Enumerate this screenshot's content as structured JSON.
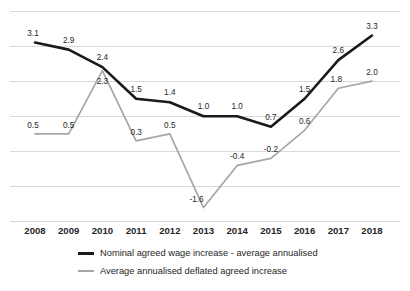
{
  "chart_data": {
    "type": "line",
    "title": "",
    "subtitle": "",
    "xlabel": "",
    "ylabel": "",
    "grid": true,
    "legend_position": "bottom",
    "categories": [
      "2008",
      "2009",
      "2010",
      "2011",
      "2012",
      "2013",
      "2014",
      "2015",
      "2016",
      "2017",
      "2018"
    ],
    "ylim": [
      -2.0,
      4.0
    ],
    "y_gridlines": [
      4.0,
      3.0,
      2.0,
      1.0,
      0.0,
      -1.0,
      -2.0
    ],
    "series": [
      {
        "name": "Nominal agreed wage increase - average annualised",
        "color": "#1a1a1a",
        "values": [
          3.1,
          2.9,
          2.4,
          1.5,
          1.4,
          1.0,
          1.0,
          0.7,
          1.5,
          2.6,
          3.3
        ],
        "labels": [
          "3.1",
          "2.9",
          "2.4",
          "1.5",
          "1.4",
          "1.0",
          "1.0",
          "0.7",
          "1.5",
          "2.6",
          "3.3"
        ]
      },
      {
        "name": "Average annualised deflated agreed increase",
        "color": "#a6a6a6",
        "values": [
          0.5,
          0.5,
          2.3,
          0.3,
          0.5,
          -1.6,
          -0.4,
          -0.2,
          0.6,
          1.8,
          2.0
        ],
        "labels": [
          "0.5",
          "0.5",
          "2.3",
          "0.3",
          "0.5",
          "-1.6",
          "-0.4",
          "-0.2",
          "0.6",
          "1.8",
          "2.0"
        ]
      }
    ]
  },
  "legend": {
    "items": [
      {
        "label": "Nominal agreed wage increase - average annualised"
      },
      {
        "label": "Average annualised deflated agreed increase"
      }
    ]
  },
  "colors": {
    "nominal": "#1a1a1a",
    "deflated": "#a6a6a6",
    "gridline": "#d9d9d9",
    "text": "#262626",
    "background": "#ffffff"
  }
}
